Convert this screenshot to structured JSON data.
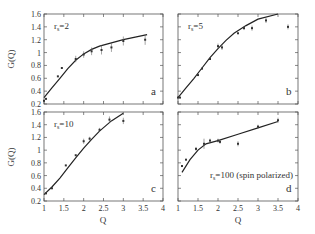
{
  "figure": {
    "y_axis_label": "G(Q)",
    "x_axis_label": "Q",
    "x_ticks": [
      "1",
      "1.5",
      "2",
      "2.5",
      "3",
      "3.5",
      "4"
    ],
    "y_ticks": [
      "0.2",
      "0.4",
      "0.6",
      "0.8",
      "1",
      "1.2",
      "1.4",
      "1.6"
    ]
  },
  "chart_data": [
    {
      "type": "line",
      "panel": "a",
      "annotation": "r_s=2",
      "xlabel": "Q",
      "ylabel": "G(Q)",
      "xlim": [
        1,
        4
      ],
      "ylim": [
        0.2,
        1.6
      ],
      "series": [
        {
          "name": "theory curve",
          "x": [
            1.0,
            1.2,
            1.4,
            1.6,
            1.8,
            2.0,
            2.2,
            2.4,
            2.7,
            3.0,
            3.3,
            3.6
          ],
          "y": [
            0.3,
            0.45,
            0.6,
            0.75,
            0.88,
            0.98,
            1.05,
            1.1,
            1.15,
            1.2,
            1.24,
            1.28
          ]
        },
        {
          "name": "data points",
          "x": [
            1.0,
            1.05,
            1.35,
            1.45,
            1.8,
            2.0,
            2.2,
            2.45,
            2.7,
            3.0,
            3.55
          ],
          "y": [
            0.25,
            0.28,
            0.63,
            0.76,
            0.9,
            0.97,
            1.02,
            1.04,
            1.08,
            1.18,
            1.2
          ],
          "yerr": [
            0.02,
            0.02,
            0.02,
            0.02,
            0.05,
            0.05,
            0.06,
            0.07,
            0.07,
            0.07,
            0.08
          ]
        }
      ]
    },
    {
      "type": "line",
      "panel": "b",
      "annotation": "r_s=5",
      "xlabel": "Q",
      "ylabel": "G(Q)",
      "xlim": [
        1,
        4
      ],
      "ylim": [
        0.2,
        1.6
      ],
      "series": [
        {
          "name": "theory curve",
          "x": [
            1.0,
            1.2,
            1.4,
            1.6,
            1.8,
            2.0,
            2.2,
            2.4,
            2.7,
            3.0,
            3.5
          ],
          "y": [
            0.3,
            0.45,
            0.6,
            0.76,
            0.92,
            1.06,
            1.19,
            1.3,
            1.42,
            1.52,
            1.62
          ]
        },
        {
          "name": "data points",
          "x": [
            1.0,
            1.05,
            1.5,
            1.6,
            1.8,
            2.0,
            2.1,
            2.5,
            2.65,
            2.85,
            3.2,
            3.75
          ],
          "y": [
            0.3,
            0.3,
            0.65,
            0.75,
            0.9,
            1.1,
            1.08,
            1.3,
            1.38,
            1.38,
            1.5,
            1.4
          ],
          "yerr": [
            0.02,
            0.02,
            0.02,
            0.02,
            0.02,
            0.04,
            0.04,
            0.02,
            0.03,
            0.04,
            0.04,
            0.04
          ]
        }
      ]
    },
    {
      "type": "line",
      "panel": "c",
      "annotation": "r_s=10",
      "xlabel": "Q",
      "ylabel": "G(Q)",
      "xlim": [
        1,
        4
      ],
      "ylim": [
        0.2,
        1.6
      ],
      "series": [
        {
          "name": "theory curve",
          "x": [
            1.0,
            1.2,
            1.4,
            1.6,
            1.8,
            2.0,
            2.2,
            2.4,
            2.7,
            3.0
          ],
          "y": [
            0.3,
            0.42,
            0.56,
            0.72,
            0.88,
            1.03,
            1.17,
            1.3,
            1.46,
            1.58
          ]
        },
        {
          "name": "data points",
          "x": [
            1.05,
            1.2,
            1.55,
            1.8,
            2.0,
            2.15,
            2.4,
            2.65,
            3.0
          ],
          "y": [
            0.32,
            0.4,
            0.76,
            0.92,
            1.14,
            1.18,
            1.32,
            1.48,
            1.46
          ],
          "yerr": [
            0.02,
            0.02,
            0.02,
            0.02,
            0.04,
            0.03,
            0.03,
            0.05,
            0.05
          ]
        }
      ]
    },
    {
      "type": "line",
      "panel": "d",
      "annotation": "r_s=100 (spin polarized)",
      "xlabel": "Q",
      "ylabel": "G(Q)",
      "xlim": [
        1,
        4
      ],
      "ylim": [
        0.2,
        1.6
      ],
      "series": [
        {
          "name": "theory curve",
          "x": [
            1.1,
            1.3,
            1.5,
            1.7,
            2.0,
            2.5,
            3.0,
            3.5
          ],
          "y": [
            0.65,
            0.85,
            1.0,
            1.1,
            1.15,
            1.25,
            1.35,
            1.45
          ]
        },
        {
          "name": "data points",
          "x": [
            1.1,
            1.2,
            1.45,
            1.65,
            1.8,
            2.0,
            2.05,
            2.5,
            3.0,
            3.5
          ],
          "y": [
            0.75,
            0.85,
            1.02,
            1.1,
            1.15,
            1.15,
            1.13,
            1.1,
            1.37,
            1.47
          ],
          "yerr": [
            0.02,
            0.02,
            0.03,
            0.08,
            0.03,
            0.03,
            0.03,
            0.04,
            0.03,
            0.04
          ]
        }
      ]
    }
  ]
}
